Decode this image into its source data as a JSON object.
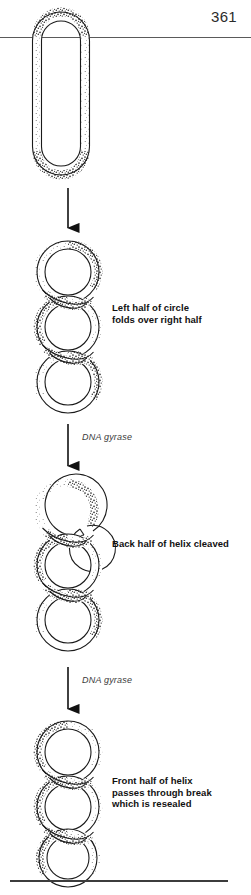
{
  "page": {
    "number": "361",
    "background_color": "#ffffff",
    "ink_color": "#1a1a1a",
    "header_rule_color": "#5a5a5a",
    "footer_rule_color": "#3c3c3c"
  },
  "figure": {
    "ribbon_fill": "#ffffff",
    "ribbon_stroke": "#1a1a1a",
    "stipple_color": "#2b2b2b",
    "stages": [
      {
        "id": "stage-1-relaxed-circle",
        "shape": "relaxed closed circular duplex (elongated oval)",
        "caption": ""
      },
      {
        "id": "stage-2-folded-figure-eight",
        "shape": "supercoiled figure-eight, three loops",
        "caption": "Left half of circle\nfolds over right half"
      },
      {
        "id": "stage-3-cleaved-helix",
        "shape": "supercoiled helix with back strand cleaved",
        "caption": "Back half of helix cleaved"
      },
      {
        "id": "stage-4-resealed-helix",
        "shape": "supercoiled helix passed through break and resealed",
        "caption": "Front half of helix\npasses through break\nwhich is resealed"
      }
    ],
    "arrows": [
      {
        "id": "arrow-1",
        "label": ""
      },
      {
        "id": "arrow-2",
        "label": "DNA gyrase"
      },
      {
        "id": "arrow-3",
        "label": "DNA gyrase"
      }
    ]
  },
  "captions": {
    "fold": "Left half of circle\nfolds over right half",
    "cleave": "Back half of helix cleaved",
    "reseal": "Front half of helix\npasses through break\nwhich is resealed"
  },
  "enzyme_labels": {
    "first": "DNA gyrase",
    "second": "DNA gyrase"
  }
}
